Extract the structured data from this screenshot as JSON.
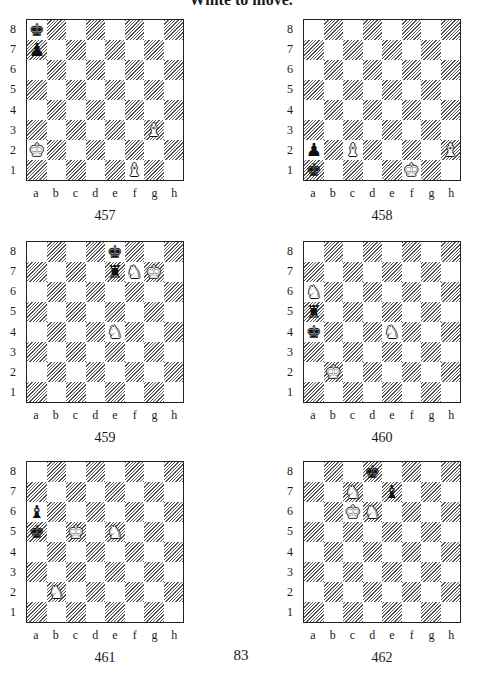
{
  "header": {
    "text": "White to move."
  },
  "page_number": "83",
  "files": [
    "a",
    "b",
    "c",
    "d",
    "e",
    "f",
    "g",
    "h"
  ],
  "ranks": [
    "8",
    "7",
    "6",
    "5",
    "4",
    "3",
    "2",
    "1"
  ],
  "diagrams": [
    {
      "number": "457",
      "pos": {
        "left": 4,
        "top": 19
      },
      "pieces": [
        {
          "square": "a8",
          "color": "black",
          "type": "king",
          "glyph": "♚"
        },
        {
          "square": "a7",
          "color": "black",
          "type": "pawn",
          "glyph": "♟"
        },
        {
          "square": "g3",
          "color": "white",
          "type": "bishop",
          "glyph": "♝"
        },
        {
          "square": "a2",
          "color": "white",
          "type": "king",
          "glyph": "♚"
        },
        {
          "square": "f1",
          "color": "white",
          "type": "bishop",
          "glyph": "♝"
        }
      ]
    },
    {
      "number": "458",
      "pos": {
        "left": 281,
        "top": 19
      },
      "pieces": [
        {
          "square": "a2",
          "color": "black",
          "type": "pawn",
          "glyph": "♟"
        },
        {
          "square": "c2",
          "color": "white",
          "type": "bishop",
          "glyph": "♝"
        },
        {
          "square": "h2",
          "color": "white",
          "type": "bishop",
          "glyph": "♝"
        },
        {
          "square": "a1",
          "color": "black",
          "type": "king",
          "glyph": "♚"
        },
        {
          "square": "f1",
          "color": "white",
          "type": "king",
          "glyph": "♚"
        }
      ]
    },
    {
      "number": "459",
      "pos": {
        "left": 4,
        "top": 241
      },
      "pieces": [
        {
          "square": "e8",
          "color": "black",
          "type": "king",
          "glyph": "♚"
        },
        {
          "square": "e7",
          "color": "black",
          "type": "rook",
          "glyph": "♜"
        },
        {
          "square": "f7",
          "color": "white",
          "type": "knight",
          "glyph": "♞"
        },
        {
          "square": "g7",
          "color": "white",
          "type": "king",
          "glyph": "♚"
        },
        {
          "square": "e4",
          "color": "white",
          "type": "knight",
          "glyph": "♞"
        }
      ]
    },
    {
      "number": "460",
      "pos": {
        "left": 281,
        "top": 241
      },
      "pieces": [
        {
          "square": "a6",
          "color": "white",
          "type": "knight",
          "glyph": "♞"
        },
        {
          "square": "a5",
          "color": "black",
          "type": "rook",
          "glyph": "♜"
        },
        {
          "square": "a4",
          "color": "black",
          "type": "king",
          "glyph": "♚"
        },
        {
          "square": "e4",
          "color": "white",
          "type": "knight",
          "glyph": "♞"
        },
        {
          "square": "b2",
          "color": "white",
          "type": "king",
          "glyph": "♚"
        }
      ]
    },
    {
      "number": "461",
      "pos": {
        "left": 4,
        "top": 461
      },
      "pieces": [
        {
          "square": "a6",
          "color": "black",
          "type": "bishop",
          "glyph": "♝"
        },
        {
          "square": "a5",
          "color": "black",
          "type": "king",
          "glyph": "♚"
        },
        {
          "square": "c5",
          "color": "white",
          "type": "king",
          "glyph": "♚"
        },
        {
          "square": "e5",
          "color": "white",
          "type": "knight",
          "glyph": "♞"
        },
        {
          "square": "b2",
          "color": "white",
          "type": "knight",
          "glyph": "♞"
        }
      ]
    },
    {
      "number": "462",
      "pos": {
        "left": 281,
        "top": 461
      },
      "pieces": [
        {
          "square": "d8",
          "color": "black",
          "type": "king",
          "glyph": "♚"
        },
        {
          "square": "c7",
          "color": "white",
          "type": "knight",
          "glyph": "♞"
        },
        {
          "square": "e7",
          "color": "black",
          "type": "bishop",
          "glyph": "♝"
        },
        {
          "square": "c6",
          "color": "white",
          "type": "king",
          "glyph": "♚"
        },
        {
          "square": "d6",
          "color": "white",
          "type": "knight",
          "glyph": "♞"
        }
      ]
    }
  ]
}
